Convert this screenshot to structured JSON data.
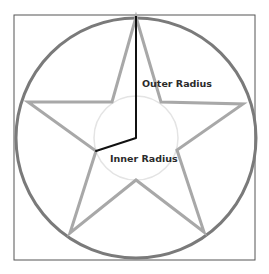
{
  "diagram": {
    "type": "geometry",
    "labels": {
      "outer_radius": "Outer Radius",
      "inner_radius": "Inner Radius"
    },
    "colors": {
      "frame": "#555555",
      "outer_circle": "#7a7a7a",
      "star": "#a8a8a8",
      "inner_circle": "#e2e2e2",
      "radius_lines": "#111111",
      "label_text": "#2b2b2b",
      "background": "#ffffff"
    },
    "geometry": {
      "frame": {
        "x": 14,
        "y": 15,
        "width": 241,
        "height": 245
      },
      "center": {
        "x": 136,
        "y": 138
      },
      "outer_circle_radius": 121,
      "inner_circle_radius": 42,
      "star_outer_points": [
        {
          "x": 136,
          "y": 17
        },
        {
          "x": 243,
          "y": 104
        },
        {
          "x": 204,
          "y": 232
        },
        {
          "x": 70,
          "y": 233
        },
        {
          "x": 28,
          "y": 102
        }
      ],
      "star_inner_points": [
        {
          "x": 161,
          "y": 102
        },
        {
          "x": 177,
          "y": 150
        },
        {
          "x": 136,
          "y": 180
        },
        {
          "x": 96,
          "y": 151
        },
        {
          "x": 112,
          "y": 102
        }
      ],
      "outer_radius_line": {
        "x1": 136,
        "y1": 17,
        "x2": 136,
        "y2": 138
      },
      "inner_radius_line": {
        "x1": 136,
        "y1": 138,
        "x2": 96,
        "y2": 151
      }
    }
  }
}
